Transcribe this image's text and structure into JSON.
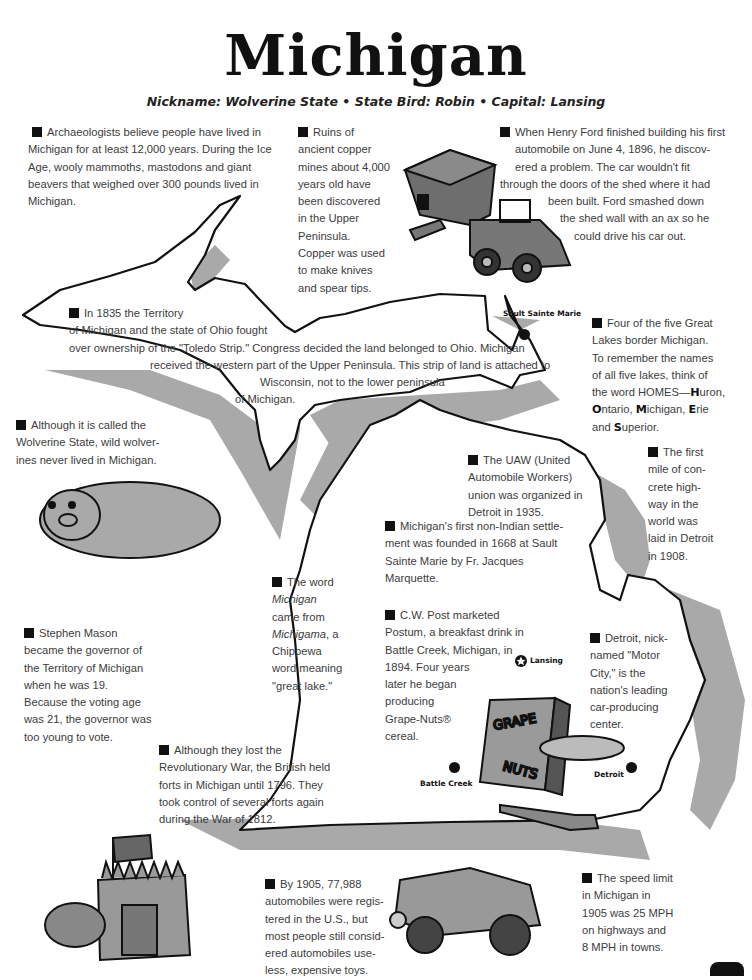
{
  "header": {
    "title": "Michigan",
    "subtitle": "Nickname: Wolverine State  •  State Bird: Robin  •  Capital: Lansing"
  },
  "facts": {
    "archaeologists": [
      "Archaeologists believe people have lived in",
      "Michigan for at least 12,000 years.  During the Ice",
      "Age, wooly mammoths, mastodons and giant",
      "beavers that weighed over 300 pounds lived in",
      "Michigan."
    ],
    "copper": [
      "Ruins of",
      "ancient copper",
      "mines about 4,000",
      "years old have",
      "been discovered",
      "in the Upper",
      "Peninsula.",
      "Copper was used",
      "to make knives",
      "and spear tips."
    ],
    "ford": [
      "When Henry Ford finished building his first",
      "automobile on June 4, 1896, he discov-",
      "ered a problem.  The car wouldn't fit",
      "through the doors of the shed where it had",
      "been built.  Ford smashed down",
      "the shed wall with an ax so he",
      "could drive his car out."
    ],
    "toledo": [
      "In 1835 the Territory",
      "of Michigan and the state of Ohio fought",
      "over ownership of the \"Toledo Strip.\"  Congress decided the land belonged to Ohio.  Michigan",
      "received the western part of the Upper Peninsula.  This strip of land is attached to",
      "Wisconsin, not to the lower peninsula",
      "of Michigan."
    ],
    "great_lakes": {
      "lines": [
        "Four of the five Great",
        "Lakes border Michigan.",
        "To remember the names",
        "of all five lakes, think of",
        "the word HOMES—"
      ],
      "lakes": [
        {
          "initial": "H",
          "rest": "uron,"
        },
        {
          "initial": "O",
          "rest": "ntario, "
        },
        {
          "initial": "M",
          "rest": "ichigan, "
        },
        {
          "initial": "E",
          "rest": "rie"
        },
        {
          "initial": "S",
          "rest": "uperior."
        }
      ],
      "and": "and "
    },
    "wolverine": [
      "Although it is called the",
      "Wolverine State, wild wolver-",
      "ines never lived in Michigan."
    ],
    "uaw": [
      "The UAW (United",
      "Automobile Workers)",
      "union was organized in",
      "Detroit in 1935."
    ],
    "highway": [
      "The first",
      "mile of con-",
      "crete high-",
      "way in the",
      "world was",
      "laid in Detroit",
      "in 1908."
    ],
    "settlement": [
      "Michigan's first non-Indian settle-",
      "ment was founded in 1668 at Sault",
      "Sainte Marie by Fr. Jacques",
      "Marquette."
    ],
    "word": {
      "l1": "The word",
      "l2": "Michigan",
      "l3": "came from",
      "l4a": "Michigama",
      "l4b": ", a",
      "l5": "Chippewa",
      "l6": "word meaning",
      "l7": "\"great lake.\""
    },
    "mason": [
      "Stephen Mason",
      "became the governor of",
      "the Territory of Michigan",
      "when he was 19.",
      "Because the voting age",
      "was 21, the governor was",
      "too young to vote."
    ],
    "post": [
      "C.W. Post marketed",
      "Postum, a breakfast drink in",
      "Battle Creek, Michigan, in",
      "1894.  Four years",
      "later he began",
      "producing",
      "Grape-Nuts®",
      "cereal."
    ],
    "detroit": [
      "Detroit, nick-",
      "named \"Motor",
      "City,\" is the",
      "nation's leading",
      "car-producing",
      "center."
    ],
    "british": [
      "Although they lost the",
      "Revolutionary War, the British held",
      "forts in Michigan until 1796.  They",
      "took control of several forts again",
      "during the War of 1812."
    ],
    "automobiles": [
      "By 1905, 77,988",
      "automobiles were regis-",
      "tered in the U.S., but",
      "most people still consid-",
      "ered automobiles use-",
      "less, expensive toys."
    ],
    "speed": [
      "The speed limit",
      "in Michigan in",
      "1905 was 25 MPH",
      "on highways and",
      "8 MPH in towns."
    ]
  },
  "cities": {
    "sault": "Sault Sainte Marie",
    "lansing": "Lansing",
    "battle_creek": "Battle Creek",
    "detroit": "Detroit"
  },
  "illustrations": {
    "cereal_box_l1": "GRAPE",
    "cereal_box_l2": "NUTS"
  },
  "colors": {
    "map_shadow": "#a9a9a9",
    "outline": "#111111",
    "text": "#3c3c3c"
  }
}
